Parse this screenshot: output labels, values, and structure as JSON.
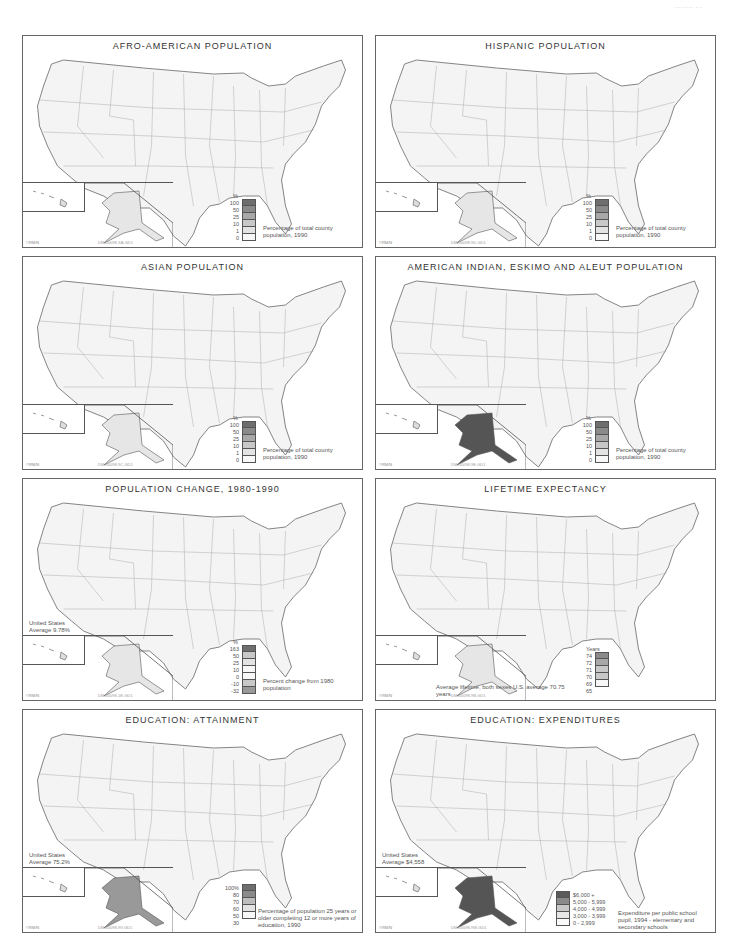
{
  "page_mark": "........ ...",
  "panels": [
    {
      "id": "afro-american",
      "title": "AFRO-AMERICAN POPULATION",
      "legend_unit": "%",
      "legend_labels": [
        "100",
        "50",
        "25",
        "10",
        "1",
        "0"
      ],
      "legend_colors": [
        "#6e6e6e",
        "#8a8a8a",
        "#a8a8a8",
        "#c8c8c8",
        "#e3e3e3",
        "#f7f7f7"
      ],
      "caption": "Percentage of total county population, 1990",
      "copyright": "©RM/N",
      "code": "DM-50098-XA-GD1"
    },
    {
      "id": "hispanic",
      "title": "HISPANIC POPULATION",
      "legend_unit": "%",
      "legend_labels": [
        "100",
        "50",
        "25",
        "10",
        "1",
        "0"
      ],
      "legend_colors": [
        "#6e6e6e",
        "#8a8a8a",
        "#a8a8a8",
        "#c8c8c8",
        "#e3e3e3",
        "#f7f7f7"
      ],
      "caption": "Percentage of total county population, 1990",
      "copyright": "©RM/N",
      "code": "DM-50098-9D-GD1"
    },
    {
      "id": "asian",
      "title": "ASIAN POPULATION",
      "legend_unit": "%",
      "legend_labels": [
        "100",
        "50",
        "25",
        "10",
        "1",
        "0"
      ],
      "legend_colors": [
        "#6e6e6e",
        "#8a8a8a",
        "#a8a8a8",
        "#c8c8c8",
        "#e3e3e3",
        "#f7f7f7"
      ],
      "caption": "Percentage of total county population, 1990",
      "copyright": "©RM/N",
      "code": "DM-50098-9C-GD1"
    },
    {
      "id": "american-indian",
      "title": "AMERICAN INDIAN, ESKIMO AND ALEUT POPULATION",
      "legend_unit": "%",
      "legend_labels": [
        "100",
        "50",
        "25",
        "10",
        "1",
        "0"
      ],
      "legend_colors": [
        "#6e6e6e",
        "#8a8a8a",
        "#a8a8a8",
        "#c8c8c8",
        "#e3e3e3",
        "#f7f7f7"
      ],
      "caption": "Percentage of total county population, 1990",
      "copyright": "©RM/N",
      "code": "DM-50098-9E-GD1"
    },
    {
      "id": "population-change",
      "title": "POPULATION CHANGE, 1980-1990",
      "legend_unit": "%",
      "legend_labels": [
        "163",
        "50",
        "25",
        "10",
        "0",
        "-10",
        "-32"
      ],
      "legend_colors": [
        "#6e6e6e",
        "#c8c8c8",
        "#e3e3e3",
        "#f7f7f7",
        "#f7f7f7",
        "#c8c8c8",
        "#999999"
      ],
      "caption": "Percent change from 1980 population",
      "average": "United States Average 9.78%",
      "copyright": "©RM/N",
      "code": "DM-50098-1E-GD1"
    },
    {
      "id": "lifetime-expectancy",
      "title": "LIFETIME EXPECTANCY",
      "legend_unit": "Years",
      "legend_labels": [
        "74",
        "72",
        "71",
        "70",
        "69",
        "65"
      ],
      "legend_colors": [
        "#8a8a8a",
        "#a8a8a8",
        "#c8c8c8",
        "#c8c8c8",
        "#f7f7f7"
      ],
      "caption": "Average lifetime, both sexes U.S. average 70.75 years",
      "copyright": "©RM/N",
      "code": "DM-50098-9B-GD1"
    },
    {
      "id": "education-attainment",
      "title": "EDUCATION: ATTAINMENT",
      "legend_unit": "",
      "legend_labels": [
        "100%",
        "80",
        "70",
        "60",
        "50",
        "30"
      ],
      "legend_colors": [
        "#6e6e6e",
        "#8a8a8a",
        "#bdbdbd",
        "#e3e3e3",
        "#f7f7f7"
      ],
      "caption": "Percentage of population 25 years or older completing 12 or more years of education, 1990",
      "average": "United States Average 75.2%",
      "copyright": "©RM/N",
      "code": "DM-50098-9V-GD1"
    },
    {
      "id": "education-expenditures",
      "title": "EDUCATION: EXPENDITURES",
      "legend_unit": "",
      "legend_labels": [
        "$6,000 +",
        "5,000 - 5,999",
        "4,000 - 4,999",
        "3,000 - 3,999",
        "0 - 2,999"
      ],
      "legend_colors": [
        "#5a5a5a",
        "#8a8a8a",
        "#c8c8c8",
        "#e6e6e6",
        "#fafafa"
      ],
      "caption": "Expenditure per public school pupil, 1994 - elementary and secondary schools",
      "average": "United States Average $4,558",
      "copyright": "©RM/N",
      "code": "DM-50098-9W-GD1"
    }
  ]
}
